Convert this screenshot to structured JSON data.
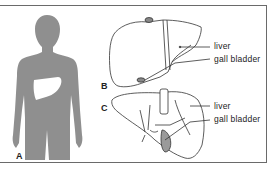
{
  "figure": {
    "panels": [
      {
        "id": "A",
        "label": "A",
        "description": "body silhouette with liver location"
      },
      {
        "id": "B",
        "label": "B",
        "description": "liver anterior view"
      },
      {
        "id": "C",
        "label": "C",
        "description": "liver inferior view"
      }
    ],
    "annotations": {
      "B": {
        "liver": "liver",
        "gall_bladder": "gall bladder"
      },
      "C": {
        "liver": "liver",
        "gall_bladder": "gall bladder"
      }
    },
    "colors": {
      "silhouette": "#8f8f8f",
      "liver_highlight": "#ffffff",
      "line": "#333333",
      "gall_bladder_fill": "#9a9a9a",
      "frame": "#6a6a6a"
    }
  }
}
